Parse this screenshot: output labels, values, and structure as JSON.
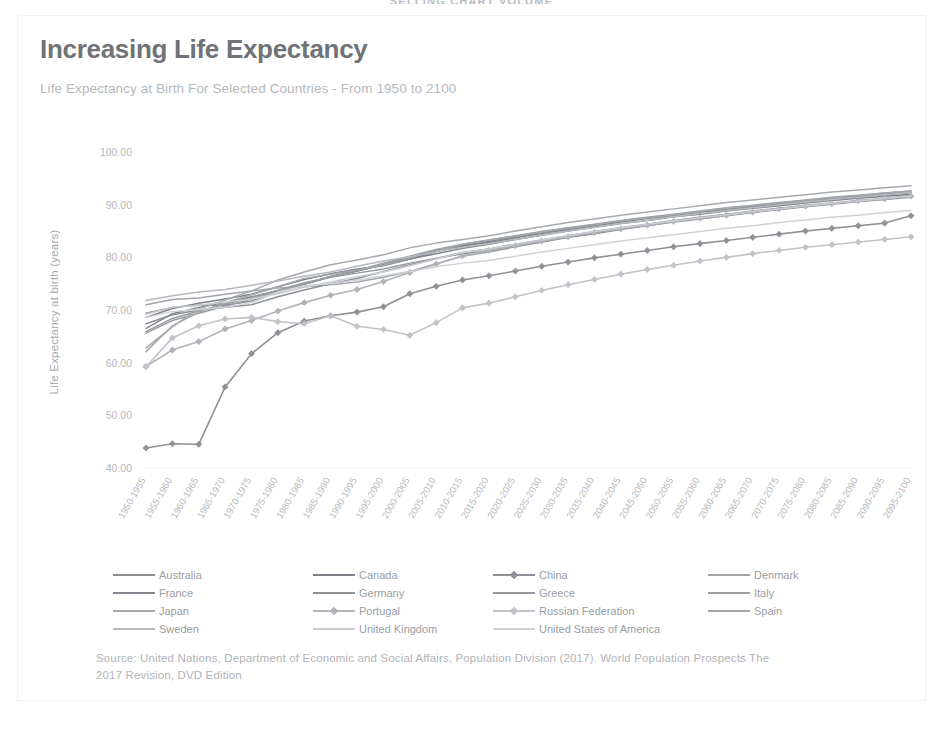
{
  "page": {
    "banner_text": "SELLING CHART VOLUME"
  },
  "card": {
    "title": "Increasing Life Expectancy",
    "subtitle": "Life Expectancy at Birth For Selected Countries - From 1950 to 2100",
    "source": "Source: United Nations, Department of Economic and Social Affairs, Population Division (2017). World Population Prospects The 2017 Revision, DVD Edition"
  },
  "colors": {
    "title": "#6f7378",
    "subtitle": "#b5b8bd",
    "axis_text": "#b5b8bd",
    "source_text": "#b0b3b8",
    "card_border": "#f0f1f3",
    "background": "#ffffff"
  },
  "chart_data": {
    "type": "line",
    "title": "Increasing Life Expectancy",
    "subtitle": "Life Expectancy at Birth For Selected Countries - From 1950 to 2100",
    "xlabel": "",
    "ylabel": "Life Expectancy at birth (years)",
    "ylim": [
      40.0,
      100.0
    ],
    "yticks": [
      40.0,
      50.0,
      60.0,
      70.0,
      80.0,
      90.0,
      100.0
    ],
    "ytick_labels": [
      "40.00",
      "50.00",
      "60.00",
      "70.00",
      "80.00",
      "90.00",
      "100.00"
    ],
    "grid": false,
    "legend_position": "bottom",
    "categories": [
      "1950-1955",
      "1955-1960",
      "1960-1965",
      "1965-1970",
      "1970-1975",
      "1975-1980",
      "1980-1985",
      "1985-1990",
      "1990-1995",
      "1995-2000",
      "2000-2005",
      "2005-2010",
      "2010-2015",
      "2015-2020",
      "2020-2025",
      "2025-2030",
      "2030-2035",
      "2035-2040",
      "2040-2045",
      "2045-2050",
      "2050-2055",
      "2055-2060",
      "2060-2065",
      "2065-2070",
      "2070-2075",
      "2075-2080",
      "2080-2085",
      "2085-2090",
      "2090-2095",
      "2095-2100"
    ],
    "series": [
      {
        "name": "Australia",
        "color": "#8a8d92",
        "marker": "none",
        "values": [
          69.4,
          70.5,
          70.9,
          70.9,
          71.7,
          73.4,
          74.9,
          76.3,
          77.4,
          78.6,
          80.1,
          81.4,
          82.3,
          83.0,
          83.9,
          84.7,
          85.4,
          86.1,
          86.8,
          87.4,
          88.0,
          88.6,
          89.1,
          89.6,
          90.1,
          90.6,
          91.1,
          91.5,
          91.9,
          92.3
        ]
      },
      {
        "name": "Canada",
        "color": "#7d8086",
        "marker": "none",
        "values": [
          68.6,
          70.3,
          71.3,
          72.1,
          73.0,
          74.4,
          75.8,
          76.9,
          77.8,
          78.4,
          79.7,
          80.7,
          81.7,
          82.5,
          83.4,
          84.2,
          85.0,
          85.7,
          86.4,
          87.0,
          87.7,
          88.2,
          88.8,
          89.3,
          89.8,
          90.3,
          90.8,
          91.2,
          91.6,
          92.0
        ]
      },
      {
        "name": "China",
        "color": "#8e9196",
        "marker": "diamond",
        "values": [
          43.8,
          44.6,
          44.5,
          55.4,
          61.7,
          65.7,
          67.9,
          68.9,
          69.6,
          70.6,
          73.1,
          74.5,
          75.7,
          76.5,
          77.4,
          78.3,
          79.1,
          79.9,
          80.6,
          81.3,
          82.0,
          82.6,
          83.2,
          83.8,
          84.4,
          85.0,
          85.5,
          86.0,
          86.5,
          87.9
        ]
      },
      {
        "name": "Denmark",
        "color": "#a1a4a9",
        "marker": "none",
        "values": [
          71.0,
          72.0,
          72.3,
          73.0,
          73.6,
          74.2,
          74.4,
          74.8,
          75.3,
          76.2,
          77.3,
          78.8,
          80.2,
          81.0,
          82.0,
          82.9,
          83.8,
          84.6,
          85.4,
          86.1,
          86.8,
          87.4,
          88.0,
          88.6,
          89.1,
          89.7,
          90.2,
          90.6,
          91.1,
          91.5
        ]
      },
      {
        "name": "France",
        "color": "#83868c",
        "marker": "none",
        "values": [
          66.5,
          69.3,
          70.5,
          71.4,
          72.5,
          73.7,
          74.9,
          76.3,
          77.4,
          78.6,
          79.7,
          81.1,
          82.1,
          82.8,
          83.7,
          84.5,
          85.3,
          86.0,
          86.7,
          87.4,
          88.0,
          88.6,
          89.1,
          89.7,
          90.2,
          90.7,
          91.1,
          91.6,
          92.0,
          92.4
        ]
      },
      {
        "name": "Germany",
        "color": "#8c8f94",
        "marker": "none",
        "values": [
          67.4,
          69.1,
          70.0,
          70.5,
          71.0,
          72.5,
          73.8,
          75.0,
          76.0,
          77.3,
          78.6,
          79.8,
          80.7,
          81.2,
          82.1,
          82.9,
          83.8,
          84.5,
          85.3,
          86.0,
          86.7,
          87.3,
          87.9,
          88.5,
          89.1,
          89.6,
          90.1,
          90.6,
          91.0,
          91.4
        ]
      },
      {
        "name": "Greece",
        "color": "#97999e",
        "marker": "none",
        "values": [
          65.9,
          68.4,
          69.8,
          71.1,
          72.4,
          73.7,
          75.2,
          76.2,
          77.0,
          77.8,
          78.9,
          79.8,
          80.9,
          81.6,
          82.5,
          83.3,
          84.1,
          84.9,
          85.6,
          86.3,
          87.0,
          87.6,
          88.2,
          88.8,
          89.3,
          89.9,
          90.3,
          90.8,
          91.2,
          91.7
        ]
      },
      {
        "name": "Italy",
        "color": "#9b9ea3",
        "marker": "none",
        "values": [
          65.6,
          68.0,
          69.4,
          70.7,
          72.1,
          73.6,
          75.0,
          76.4,
          77.5,
          78.9,
          80.2,
          81.5,
          82.5,
          83.3,
          84.1,
          84.9,
          85.6,
          86.3,
          87.0,
          87.6,
          88.2,
          88.8,
          89.4,
          89.9,
          90.4,
          90.9,
          91.4,
          91.8,
          92.2,
          92.6
        ]
      },
      {
        "name": "Japan",
        "color": "#a6a9ae",
        "marker": "none",
        "values": [
          62.8,
          66.8,
          70.2,
          71.9,
          73.6,
          75.7,
          77.2,
          78.6,
          79.5,
          80.5,
          81.8,
          82.7,
          83.4,
          84.1,
          85.0,
          85.8,
          86.6,
          87.3,
          88.0,
          88.6,
          89.2,
          89.8,
          90.4,
          90.9,
          91.4,
          91.9,
          92.4,
          92.8,
          93.2,
          93.6
        ]
      },
      {
        "name": "Portugal",
        "color": "#b0b3b8",
        "marker": "diamond",
        "values": [
          59.3,
          62.4,
          64.0,
          66.4,
          68.0,
          69.8,
          71.4,
          72.8,
          73.9,
          75.4,
          77.1,
          78.7,
          80.3,
          81.3,
          82.2,
          83.1,
          83.9,
          84.7,
          85.4,
          86.1,
          86.8,
          87.4,
          88.0,
          88.6,
          89.2,
          89.7,
          90.2,
          90.7,
          91.1,
          91.6
        ]
      },
      {
        "name": "Russian Federation",
        "color": "#c0c3c8",
        "marker": "diamond",
        "values": [
          59.2,
          64.7,
          67.0,
          68.3,
          68.6,
          67.8,
          67.4,
          68.9,
          66.9,
          66.3,
          65.2,
          67.6,
          70.4,
          71.3,
          72.5,
          73.7,
          74.8,
          75.8,
          76.8,
          77.7,
          78.5,
          79.3,
          80.0,
          80.7,
          81.3,
          81.9,
          82.4,
          82.9,
          83.4,
          83.9
        ]
      },
      {
        "name": "Spain",
        "color": "#a3a6ab",
        "marker": "none",
        "values": [
          62.1,
          67.0,
          69.6,
          71.4,
          72.9,
          74.4,
          76.0,
          76.8,
          77.6,
          78.5,
          79.9,
          81.2,
          82.5,
          83.3,
          84.0,
          84.8,
          85.5,
          86.2,
          86.9,
          87.5,
          88.1,
          88.7,
          89.3,
          89.8,
          90.3,
          90.8,
          91.3,
          91.7,
          92.2,
          92.6
        ]
      },
      {
        "name": "Sweden",
        "color": "#b5b8bd",
        "marker": "none",
        "values": [
          71.8,
          72.7,
          73.4,
          73.9,
          74.7,
          75.5,
          76.4,
          77.2,
          78.3,
          79.3,
          80.1,
          81.1,
          81.9,
          82.6,
          83.4,
          84.2,
          85.0,
          85.7,
          86.4,
          87.0,
          87.7,
          88.3,
          88.9,
          89.4,
          90.0,
          90.5,
          91.0,
          91.4,
          91.9,
          92.3
        ]
      },
      {
        "name": "United Kingdom",
        "color": "#c8cbd0",
        "marker": "none",
        "values": [
          69.2,
          70.5,
          70.9,
          71.5,
          72.1,
          73.1,
          74.3,
          75.3,
          76.3,
          77.2,
          78.4,
          79.7,
          80.9,
          81.6,
          82.5,
          83.3,
          84.1,
          84.9,
          85.6,
          86.3,
          86.9,
          87.5,
          88.1,
          88.7,
          89.2,
          89.8,
          90.3,
          90.7,
          91.2,
          91.6
        ]
      },
      {
        "name": "United States of America",
        "color": "#cfd2d7",
        "marker": "none",
        "values": [
          68.6,
          69.7,
          70.1,
          70.5,
          71.4,
          73.4,
          74.6,
          75.0,
          75.7,
          76.5,
          77.3,
          78.2,
          78.9,
          79.4,
          80.2,
          81.0,
          81.7,
          82.4,
          83.1,
          83.7,
          84.3,
          84.9,
          85.5,
          86.0,
          86.6,
          87.1,
          87.6,
          88.0,
          88.5,
          88.9
        ]
      }
    ]
  },
  "legend": {
    "items": [
      {
        "label": "Australia"
      },
      {
        "label": "Canada"
      },
      {
        "label": "China"
      },
      {
        "label": "Denmark"
      },
      {
        "label": "France"
      },
      {
        "label": "Germany"
      },
      {
        "label": "Greece"
      },
      {
        "label": "Italy"
      },
      {
        "label": "Japan"
      },
      {
        "label": "Portugal"
      },
      {
        "label": "Russian Federation"
      },
      {
        "label": "Spain"
      },
      {
        "label": "Sweden"
      },
      {
        "label": "United Kingdom"
      },
      {
        "label": "United States of America"
      }
    ]
  }
}
